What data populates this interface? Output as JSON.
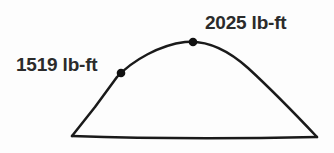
{
  "figure": {
    "background_color": "#fdfdfd",
    "stroke_color": "#1a1a1a",
    "text_color": "#2b2b2b",
    "marker_color": "#111111",
    "stroke_width": 2.5,
    "width": 334,
    "height": 153
  },
  "annotations": {
    "mid_point": {
      "label": "1519 lb-ft",
      "value": 1519,
      "units": "lb-ft",
      "marker_x": 121,
      "marker_y": 73
    },
    "peak_point": {
      "label": "2025 lb-ft",
      "value": 2025,
      "units": "lb-ft",
      "marker_x": 193,
      "marker_y": 42
    }
  },
  "chart_data": {
    "type": "line",
    "title": "",
    "xlabel": "",
    "ylabel": "",
    "grid": false,
    "legend": null,
    "series": [
      {
        "name": "torque-curve",
        "points": [
          [
            72,
            136
          ],
          [
            121,
            73
          ],
          [
            193,
            42
          ],
          [
            317,
            137
          ]
        ]
      },
      {
        "name": "baseline",
        "points": [
          [
            72,
            136
          ],
          [
            317,
            137
          ]
        ]
      }
    ],
    "markers": [
      {
        "label": "1519 lb-ft",
        "x": 121,
        "y": 73,
        "value": 1519
      },
      {
        "label": "2025 lb-ft",
        "x": 193,
        "y": 42,
        "value": 2025
      }
    ],
    "curve_path": "M 72 136 L 95 107 L 117 77 C 133 60 160 45 185 42 C 206 40 228 50 248 68 C 272 90 300 119 317 137",
    "baseline_path": "M 72 136 C 130 138 220 139 317 137"
  }
}
